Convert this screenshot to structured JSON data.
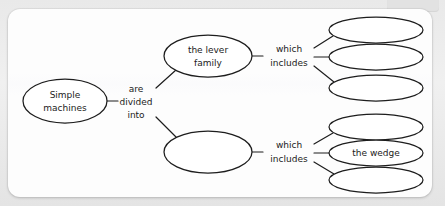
{
  "canvas": {
    "width": 445,
    "height": 206,
    "background_color": "#e9e9e9",
    "card_color": "#fdfdfd",
    "stroke_color": "#1d1d1d",
    "text_color": "#1b1b1b"
  },
  "diagram": {
    "type": "concept-map",
    "root": {
      "id": "root",
      "label": "Simple\nmachines",
      "line1": "Simple",
      "line2": "machines",
      "cx": 65,
      "cy": 101,
      "rx": 42,
      "ry": 22
    },
    "root_link": {
      "id": "root-link",
      "line1": "are",
      "line2": "divided",
      "line3": "into",
      "x": 136,
      "y": 101
    },
    "branches": [
      {
        "id": "branch-lever",
        "label": "the lever\nfamily",
        "line1": "the lever",
        "line2": "family",
        "cx": 208,
        "cy": 56,
        "rx": 44,
        "ry": 21,
        "link": {
          "id": "lever-link",
          "line1": "which",
          "line2": "includes",
          "x": 289,
          "y": 56
        },
        "children": [
          {
            "id": "lever-child-1",
            "label": "",
            "cx": 376,
            "cy": 30,
            "rx": 47,
            "ry": 13
          },
          {
            "id": "lever-child-2",
            "label": "",
            "cx": 376,
            "cy": 57,
            "rx": 47,
            "ry": 13
          },
          {
            "id": "lever-child-3",
            "label": "",
            "cx": 376,
            "cy": 88,
            "rx": 47,
            "ry": 13
          }
        ]
      },
      {
        "id": "branch-unnamed",
        "label": "",
        "line1": "",
        "line2": "",
        "cx": 208,
        "cy": 152,
        "rx": 44,
        "ry": 21,
        "link": {
          "id": "unnamed-link",
          "line1": "which",
          "line2": "includes",
          "x": 289,
          "y": 152
        },
        "children": [
          {
            "id": "wedge-sibling-1",
            "label": "",
            "cx": 376,
            "cy": 127,
            "rx": 47,
            "ry": 13
          },
          {
            "id": "wedge",
            "label": "the wedge",
            "cx": 376,
            "cy": 153,
            "rx": 47,
            "ry": 13
          },
          {
            "id": "wedge-sibling-2",
            "label": "",
            "cx": 376,
            "cy": 180,
            "rx": 47,
            "ry": 13
          }
        ]
      }
    ]
  }
}
